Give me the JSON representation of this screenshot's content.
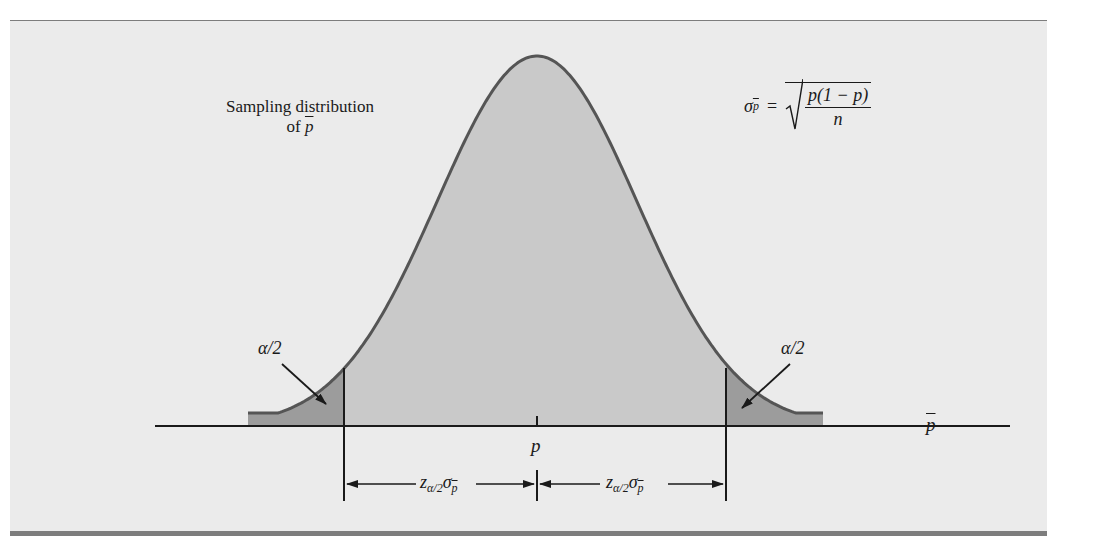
{
  "figure": {
    "labels": {
      "sampling_line1": "Sampling distribution",
      "sampling_line2_prefix": "of ",
      "sampling_line2_var": "p",
      "sigma_symbol": "σ",
      "sigma_subscript": "p",
      "equals": "=",
      "formula_numerator": "p(1 − p)",
      "formula_denominator": "n",
      "alpha_left": "α/2",
      "alpha_right": "α/2",
      "axis_label": "p",
      "center_label": "p",
      "margin_left_z": "z",
      "margin_left_sub": "α/2",
      "margin_left_sigma": "σ",
      "margin_left_sigma_sub": "p",
      "margin_right_z": "z",
      "margin_right_sub": "α/2",
      "margin_right_sigma": "σ",
      "margin_right_sigma_sub": "p"
    },
    "colors": {
      "panel_background": "#ebebeb",
      "rule": "#7d7d7d",
      "curve_fill": "#c9c9c9",
      "tail_fill": "#9c9c9c",
      "curve_stroke": "#555555",
      "line": "#1a1a1a"
    }
  },
  "chart_data": {
    "type": "area",
    "distribution": "normal",
    "mean_label": "p",
    "std_error_formula": "σ_p̄ = sqrt(p(1 − p)/n)",
    "xlabel": "p̄",
    "ylabel": "",
    "shaded_tails": [
      {
        "side": "left",
        "area_label": "α/2",
        "boundary": "p − z_{α/2} σ_p̄"
      },
      {
        "side": "right",
        "area_label": "α/2",
        "boundary": "p + z_{α/2} σ_p̄"
      }
    ],
    "interval_annotations": [
      {
        "from": "p − z_{α/2} σ_p̄",
        "to": "p",
        "label": "z_{α/2} σ_p̄"
      },
      {
        "from": "p",
        "to": "p + z_{α/2} σ_p̄",
        "label": "z_{α/2} σ_p̄"
      }
    ],
    "grid": false,
    "legend": "none"
  }
}
